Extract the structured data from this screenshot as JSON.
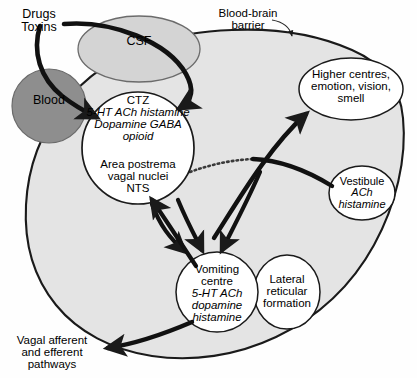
{
  "figure": {
    "type": "biomedical-pathway-diagram"
  },
  "labels": {
    "drugs_toxins": "Drugs\nToxins",
    "blood_brain_barrier": "Blood-brain\nbarrier",
    "csf": "CSF",
    "blood": "Blood",
    "ctz_name": "CTZ",
    "ctz_transmitters": "5-HT ACh histamine\nDopamine GABA\nopioid",
    "ctz_lower": "Area postrema\nvagal nuclei\nNTS",
    "higher_centres": "Higher centres,\nemotion, vision,\nsmell",
    "vestibule_name": "Vestibule",
    "vestibule_transmitters": "ACh\nhistamine",
    "vomiting_centre_name": "Vomiting\ncentre",
    "vomiting_centre_transmitters": "5-HT ACh\ndopamine\nhistamine",
    "lateral_reticular_formation": "Lateral\nreticular\nformation",
    "vagal_pathways": "Vagal afferent\nand efferent\npathways"
  },
  "nodes": [
    {
      "id": "csf",
      "label": "CSF",
      "shape": "ellipse",
      "fill": "#d4d4d4",
      "cx": 139,
      "cy": 49,
      "rx": 61,
      "ry": 33
    },
    {
      "id": "blood",
      "label": "Blood",
      "shape": "circle",
      "fill": "#8e8e8e",
      "cx": 49,
      "cy": 106,
      "rx": 37,
      "ry": 37
    },
    {
      "id": "ctz",
      "label": "CTZ",
      "shape": "circle",
      "fill": "#ffffff",
      "cx": 138,
      "cy": 148,
      "rx": 56,
      "ry": 56
    },
    {
      "id": "higher-centres",
      "label": "Higher centres, emotion, vision, smell",
      "shape": "ellipse",
      "fill": "#ffffff",
      "cx": 351,
      "cy": 89,
      "rx": 52,
      "ry": 31
    },
    {
      "id": "vestibule",
      "label": "Vestibule",
      "shape": "ellipse",
      "fill": "#ffffff",
      "cx": 362,
      "cy": 193,
      "rx": 33,
      "ry": 27
    },
    {
      "id": "vomiting-centre",
      "label": "Vomiting centre",
      "shape": "ellipse",
      "fill": "#ffffff",
      "cx": 217,
      "cy": 292,
      "rx": 41,
      "ry": 40
    },
    {
      "id": "lateral-reticular-formation",
      "label": "Lateral reticular formation",
      "shape": "ellipse",
      "fill": "#ffffff",
      "cx": 287,
      "cy": 292,
      "rx": 33,
      "ry": 37
    },
    {
      "id": "brain-body",
      "label": "Brain (CNS outline)",
      "shape": "blob",
      "fill": "#e4e4e4"
    }
  ],
  "edges": [
    {
      "from": "drugs-toxins",
      "to": "csf-to-ctz",
      "style": "thick-arrow"
    },
    {
      "from": "drugs-toxins",
      "to": "blood-to-ctz",
      "style": "thick-arrow"
    },
    {
      "from": "ctz",
      "to": "vomiting-centre",
      "style": "thick-arrow"
    },
    {
      "from": "higher-centres",
      "to": "vomiting-centre",
      "style": "thick-arrow"
    },
    {
      "from": "vestibule",
      "to": "vomiting-centre",
      "style": "thick-arrow"
    },
    {
      "from": "vomiting-centre",
      "to": "ctz",
      "style": "thick-arrow"
    },
    {
      "from": "ctz-area",
      "to": "higher-centres",
      "style": "thick-arrow"
    },
    {
      "from": "vomiting-centre",
      "to": "vagal-pathways",
      "style": "thick-arrow"
    },
    {
      "from": "blood-brain-barrier-label",
      "to": "brain-outline",
      "style": "thin-pointer-arrow"
    },
    {
      "from": "ctz",
      "to": "bbb-gap",
      "style": "dotted-line"
    }
  ],
  "colors": {
    "stroke": "#1a1a1a",
    "brain_fill": "#e4e4e4",
    "csf_fill": "#d4d4d4",
    "blood_fill": "#8e8e8e",
    "node_fill": "#ffffff",
    "text": "#000000"
  }
}
